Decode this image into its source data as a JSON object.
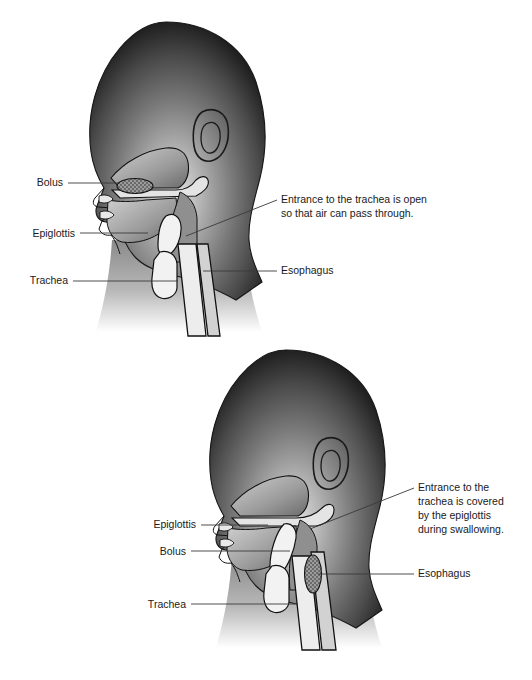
{
  "document": {
    "type": "anatomical-diagram",
    "subject": "Swallowing mechanism — sagittal section of head and neck",
    "background_color": "#ffffff",
    "text_color": "#1a1a1a",
    "leader_line_color": "#3a3a3a"
  },
  "figures": [
    {
      "id": "breathing",
      "name": "Trachea open (breathing)",
      "labels_left": [
        {
          "key": "bolus",
          "text": "Bolus",
          "x": 63,
          "y": 186,
          "leader": {
            "x1": 68,
            "y1": 183,
            "x2": 118,
            "y2": 183
          }
        },
        {
          "key": "epiglottis",
          "text": "Epiglottis",
          "x": 75,
          "y": 237,
          "leader": {
            "x1": 80,
            "y1": 233,
            "x2": 148,
            "y2": 233
          }
        },
        {
          "key": "trachea",
          "text": "Trachea",
          "x": 68,
          "y": 284,
          "leader": {
            "x1": 73,
            "y1": 281,
            "x2": 178,
            "y2": 281
          }
        }
      ],
      "labels_right": [
        {
          "key": "trachea-entrance",
          "lines": [
            "Entrance to the trachea is open",
            "so that air can pass through."
          ],
          "x": 281,
          "y": 203,
          "line_height": 14,
          "leader": {
            "x1": 277,
            "y1": 200,
            "x2": 186,
            "y2": 236
          }
        },
        {
          "key": "esophagus",
          "lines": [
            "Esophagus"
          ],
          "x": 281,
          "y": 274,
          "line_height": 14,
          "leader": {
            "x1": 277,
            "y1": 271,
            "x2": 203,
            "y2": 271
          }
        }
      ]
    },
    {
      "id": "swallowing",
      "name": "Trachea covered by epiglottis (swallowing)",
      "labels_left": [
        {
          "key": "epiglottis",
          "text": "Epiglottis",
          "x": 196,
          "y": 528,
          "leader": {
            "x1": 201,
            "y1": 525,
            "x2": 268,
            "y2": 525
          }
        },
        {
          "key": "bolus",
          "text": "Bolus",
          "x": 186,
          "y": 555,
          "leader": {
            "x1": 191,
            "y1": 551,
            "x2": 290,
            "y2": 551
          }
        },
        {
          "key": "trachea",
          "text": "Trachea",
          "x": 186,
          "y": 608,
          "leader": {
            "x1": 191,
            "y1": 604,
            "x2": 295,
            "y2": 604
          }
        }
      ],
      "labels_right": [
        {
          "key": "trachea-covered",
          "lines": [
            "Entrance to the",
            "trachea is covered",
            "by the epiglottis",
            "during swallowing."
          ],
          "x": 418,
          "y": 491,
          "line_height": 14,
          "leader": {
            "x1": 414,
            "y1": 488,
            "x2": 310,
            "y2": 529
          }
        },
        {
          "key": "esophagus",
          "lines": [
            "Esophagus"
          ],
          "x": 418,
          "y": 577,
          "line_height": 14,
          "leader": {
            "x1": 414,
            "y1": 574,
            "x2": 318,
            "y2": 574
          }
        }
      ]
    }
  ],
  "palette": {
    "head_dark": "#1e1e1e",
    "head_mid": "#6e6e6e",
    "head_light": "#d8d8d8",
    "airway_fill": "#ffffff",
    "cavity_fill": "#9a9a9a",
    "bolus_fill": "#8a8a8a",
    "outline": "#111111"
  }
}
